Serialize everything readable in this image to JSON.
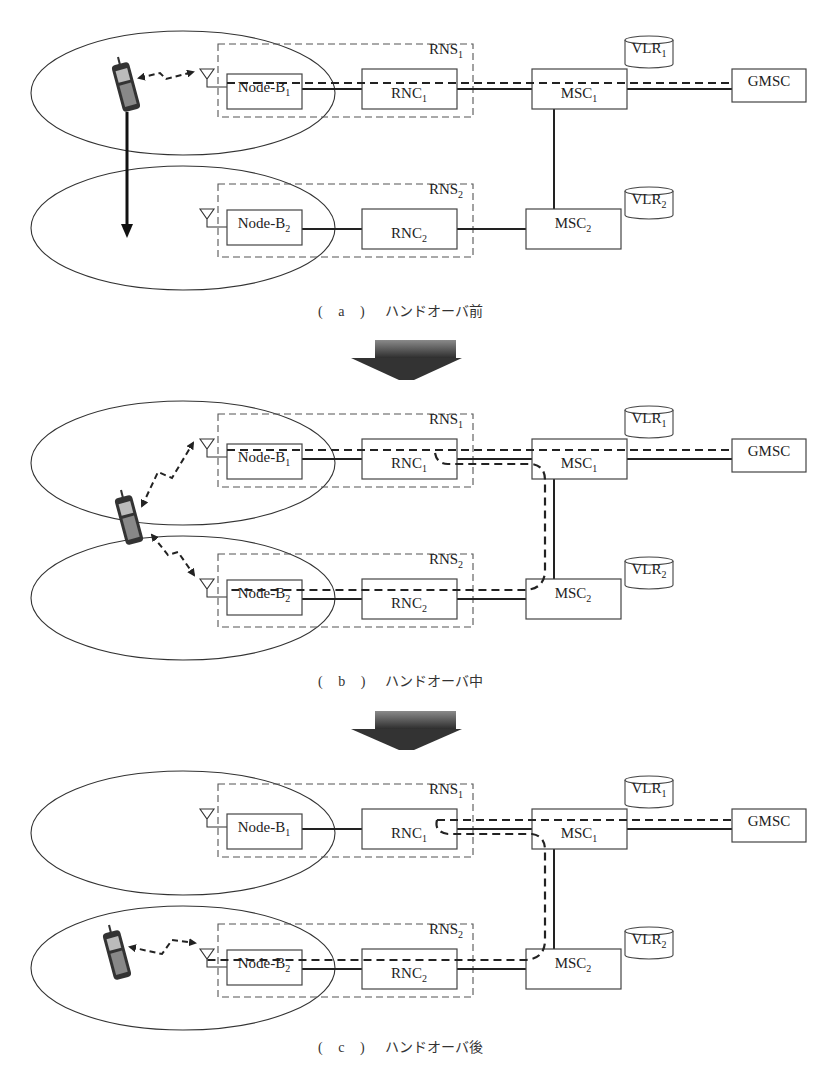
{
  "figure": {
    "panels": [
      {
        "id": "a",
        "caption_tag": "( a )",
        "caption_text": "ハンドオーバ前",
        "state": "before-handover",
        "mobile_location": "cell-1",
        "radio_links": [
          "Node-B1"
        ],
        "call_path": "MS - Node-B1 - RNC1 - MSC1 - GMSC"
      },
      {
        "id": "b",
        "caption_tag": "( b )",
        "caption_text": "ハンドオーバ中",
        "state": "during-handover",
        "mobile_location": "cell-1/cell-2 boundary",
        "radio_links": [
          "Node-B1",
          "Node-B2"
        ],
        "call_path": "MS - Node-B1/Node-B2 - RNC1 & RNC2 - MSC2 - MSC1 - GMSC"
      },
      {
        "id": "c",
        "caption_tag": "( c )",
        "caption_text": "ハンドオーバ後",
        "state": "after-handover",
        "mobile_location": "cell-2",
        "radio_links": [
          "Node-B2"
        ],
        "call_path": "MS - Node-B2 - RNC2 - MSC2 - MSC1 - GMSC"
      }
    ],
    "nodes": {
      "node_b1": {
        "base": "Node-B",
        "sub": "1"
      },
      "node_b2": {
        "base": "Node-B",
        "sub": "2"
      },
      "rnc1": {
        "base": "RNC",
        "sub": "1"
      },
      "rnc2": {
        "base": "RNC",
        "sub": "2"
      },
      "msc1": {
        "base": "MSC",
        "sub": "1"
      },
      "msc2": {
        "base": "MSC",
        "sub": "2"
      },
      "vlr1": {
        "base": "VLR",
        "sub": "1"
      },
      "vlr2": {
        "base": "VLR",
        "sub": "2"
      },
      "rns1": {
        "base": "RNS",
        "sub": "1"
      },
      "rns2": {
        "base": "RNS",
        "sub": "2"
      },
      "gmsc": {
        "base": "GMSC",
        "sub": ""
      }
    },
    "colors": {
      "line": "#222222",
      "arrow_dark": "#3a3a3a",
      "arrow_light": "#8a8a8a"
    }
  }
}
